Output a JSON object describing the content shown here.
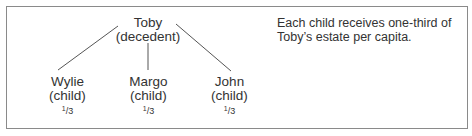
{
  "diagram": {
    "root": {
      "name": "Toby",
      "role": "(decedent)"
    },
    "children": [
      {
        "name": "Wylie",
        "role": "(child)",
        "share_num": "1",
        "share_den": "3"
      },
      {
        "name": "Margo",
        "role": "(child)",
        "share_num": "1",
        "share_den": "3"
      },
      {
        "name": "John",
        "role": "(child)",
        "share_num": "1",
        "share_den": "3"
      }
    ],
    "note_line1": "Each child receives one-third of",
    "note_line2": "Toby’s estate per capita.",
    "colors": {
      "border": "#8a8a8a",
      "line": "#555555",
      "text": "#333333"
    }
  }
}
